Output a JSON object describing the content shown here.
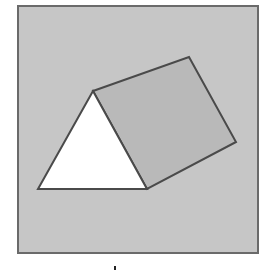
{
  "figure": {
    "colors": {
      "frame_fill": "#c6c6c6",
      "frame_stroke": "#6a6a6a",
      "square_fill": "#b9b9b9",
      "triangle_fill": "#ffffff",
      "shape_stroke": "#4a4a4a"
    },
    "frame": {
      "x": 18,
      "y": 6,
      "width": 240,
      "height": 247
    },
    "triangle": {
      "points": [
        [
          93,
          91
        ],
        [
          38,
          189
        ],
        [
          147,
          189
        ]
      ]
    },
    "square": {
      "points": [
        [
          93,
          91
        ],
        [
          189,
          57
        ],
        [
          236,
          142
        ],
        [
          147,
          189
        ]
      ]
    }
  }
}
